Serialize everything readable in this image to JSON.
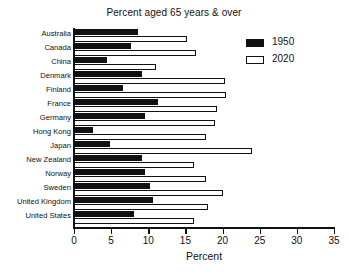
{
  "chart_data": {
    "type": "bar",
    "orientation": "horizontal",
    "title": "Percent aged 65 years & over",
    "xlabel": "Percent",
    "ylabel": "",
    "xlim": [
      0,
      35
    ],
    "xticks": [
      0,
      5,
      10,
      15,
      20,
      25,
      30,
      35
    ],
    "xtick_labels": [
      "0",
      "5",
      "10",
      "15",
      "20",
      "25",
      "30",
      "35"
    ],
    "grid": false,
    "legend_position": "top-right",
    "categories": [
      "Australia",
      "Canada",
      "China",
      "Denmark",
      "Finland",
      "France",
      "Germany",
      "Hong Kong",
      "Japan",
      "New Zealand",
      "Norway",
      "Sweden",
      "United Kingdom",
      "United States"
    ],
    "series": [
      {
        "name": "1950",
        "color": "#111111",
        "style": "filled",
        "values": [
          8.6,
          7.7,
          4.4,
          9.1,
          6.6,
          11.3,
          9.6,
          2.5,
          4.9,
          9.1,
          9.6,
          10.2,
          10.7,
          8.1
        ]
      },
      {
        "name": "2020",
        "color": "#ffffff",
        "style": "hollow",
        "values": [
          15.2,
          16.4,
          11.0,
          20.3,
          20.5,
          19.3,
          19.0,
          17.8,
          23.9,
          16.1,
          17.8,
          20.0,
          18.1,
          16.2
        ]
      }
    ]
  }
}
